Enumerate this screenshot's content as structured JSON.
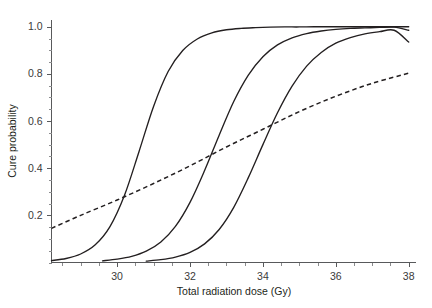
{
  "chart_data": {
    "type": "line",
    "title": "",
    "subtitle": "",
    "xlabel": "Total radiation dose (Gy)",
    "ylabel": "Cure probability",
    "xlim": [
      28.2,
      38.2
    ],
    "ylim": [
      0.0,
      1.02
    ],
    "grid": false,
    "legend": "none",
    "x_major_ticks": [
      30,
      32,
      34,
      36,
      38
    ],
    "x_major_tick_labels": [
      "30",
      "32",
      "34",
      "36",
      "38"
    ],
    "x_minor_tick_interval": 0.5,
    "y_major_ticks": [
      0.2,
      0.4,
      0.6,
      0.8,
      1.0
    ],
    "y_major_tick_labels": [
      "0.2",
      "0.4",
      "0.6",
      "0.8",
      "1.0"
    ],
    "y_minor_tick_interval": 0.05,
    "series": [
      {
        "name": "curve-1",
        "style": "solid",
        "color": "#231f20",
        "midpoint": 30.62,
        "slope": 1.95,
        "asymptote": 1.0,
        "x": [
          28.2,
          28.6,
          29.0,
          29.4,
          29.8,
          30.2,
          30.6,
          31.0,
          31.4,
          31.8,
          32.2,
          32.6,
          33.0,
          33.4,
          33.8,
          34.2,
          34.6,
          35.0,
          35.4,
          35.8,
          36.2,
          36.6,
          37.0,
          37.4,
          37.8,
          38.0
        ],
        "y": [
          0.008,
          0.017,
          0.036,
          0.075,
          0.151,
          0.284,
          0.47,
          0.662,
          0.81,
          0.899,
          0.948,
          0.974,
          0.987,
          0.993,
          0.996,
          0.998,
          0.999,
          0.999,
          1.0,
          1.0,
          1.0,
          1.0,
          1.0,
          1.0,
          1.0,
          1.0
        ]
      },
      {
        "name": "curve-2",
        "style": "solid",
        "color": "#231f20",
        "midpoint": 32.72,
        "slope": 1.55,
        "asymptote": 0.99,
        "x": [
          29.6,
          30.0,
          30.4,
          30.8,
          31.2,
          31.6,
          32.0,
          32.4,
          32.8,
          33.2,
          33.6,
          34.0,
          34.4,
          34.8,
          35.2,
          35.6,
          36.0,
          36.4,
          36.8,
          37.2,
          37.6,
          38.0
        ],
        "y": [
          0.007,
          0.014,
          0.026,
          0.048,
          0.087,
          0.153,
          0.255,
          0.39,
          0.54,
          0.683,
          0.795,
          0.873,
          0.923,
          0.953,
          0.971,
          0.982,
          0.989,
          0.993,
          0.995,
          0.997,
          0.998,
          0.985
        ]
      },
      {
        "name": "curve-3",
        "style": "solid",
        "color": "#231f20",
        "midpoint": 33.72,
        "slope": 1.35,
        "asymptote": 0.96,
        "x": [
          30.8,
          31.2,
          31.6,
          32.0,
          32.4,
          32.8,
          33.2,
          33.6,
          34.0,
          34.4,
          34.8,
          35.2,
          35.6,
          36.0,
          36.4,
          36.8,
          37.2,
          37.6,
          38.0
        ],
        "y": [
          0.006,
          0.012,
          0.023,
          0.043,
          0.079,
          0.14,
          0.234,
          0.36,
          0.5,
          0.635,
          0.748,
          0.833,
          0.891,
          0.93,
          0.954,
          0.97,
          0.979,
          0.985,
          0.935
        ]
      },
      {
        "name": "dashed-reference",
        "style": "dashed",
        "color": "#231f20",
        "x": [
          28.2,
          29.0,
          30.0,
          31.0,
          32.0,
          33.0,
          34.0,
          35.0,
          36.0,
          37.0,
          38.0
        ],
        "y": [
          0.145,
          0.2,
          0.265,
          0.335,
          0.41,
          0.49,
          0.565,
          0.64,
          0.705,
          0.76,
          0.803
        ]
      }
    ],
    "annotations": [],
    "intersections": [
      {
        "x": 30.44,
        "y": 0.315,
        "between": [
          "curve-1",
          "dashed-reference"
        ]
      },
      {
        "x": 32.68,
        "y": 0.528,
        "between": [
          "curve-2",
          "dashed-reference"
        ]
      },
      {
        "x": 35.22,
        "y": 0.676,
        "between": [
          "curve-3",
          "dashed-reference"
        ]
      }
    ]
  },
  "figure": {
    "background_color": "#ffffff",
    "axis_color": "#58595b",
    "text_color": "#231f20"
  }
}
